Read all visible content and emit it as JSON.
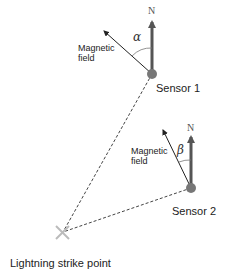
{
  "diagram": {
    "sensor1": {
      "label": "Sensor 1",
      "north_label": "N",
      "angle_label": "α",
      "field_label_line1": "Magnetic",
      "field_label_line2": "field"
    },
    "sensor2": {
      "label": "Sensor 2",
      "north_label": "N",
      "angle_label": "β",
      "field_label_line1": "Magnetic",
      "field_label_line2": "field"
    },
    "strike": {
      "label": "Lightning strike point"
    },
    "colors": {
      "sensor": "#777777",
      "north_arrow": "#555555",
      "field_arrow": "#222222",
      "dashed_line": "#444444",
      "strike_marker": "#bbbbbb"
    }
  }
}
